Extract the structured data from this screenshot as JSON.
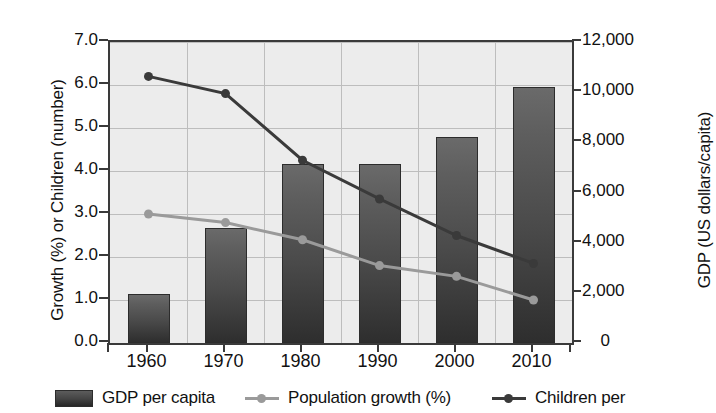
{
  "chart_data": {
    "type": "line",
    "title": "",
    "categories": [
      "1960",
      "1970",
      "1980",
      "1990",
      "2000",
      "2010"
    ],
    "x": [
      1960,
      1970,
      1980,
      1990,
      2000,
      2010
    ],
    "xlabel": "",
    "grid": true,
    "legend_position": "bottom",
    "left_axis": {
      "label": "Growth (%) or Children (number)",
      "ticks": [
        "0.0",
        "1.0",
        "2.0",
        "3.0",
        "4.0",
        "5.0",
        "6.0",
        "7.0"
      ],
      "tick_values": [
        0.0,
        1.0,
        2.0,
        3.0,
        4.0,
        5.0,
        6.0,
        7.0
      ],
      "ylim": [
        0.0,
        7.0
      ]
    },
    "right_axis": {
      "label": "GDP (US dollars/capita)",
      "ticks": [
        "0",
        "2,000",
        "4,000",
        "6,000",
        "8,000",
        "10,000",
        "12,000"
      ],
      "tick_values": [
        0,
        2000,
        4000,
        6000,
        8000,
        10000,
        12000
      ],
      "ylim": [
        0,
        12000
      ]
    },
    "series": [
      {
        "name": "GDP per capita",
        "type": "bar",
        "axis": "right",
        "color": "#3f3f3f",
        "values": [
          1970,
          4600,
          7150,
          7150,
          8200,
          10200
        ]
      },
      {
        "name": "Population growth (%)",
        "type": "line",
        "axis": "left",
        "color": "#9a9a9a",
        "values": [
          3.0,
          2.8,
          2.4,
          1.8,
          1.55,
          1.0
        ]
      },
      {
        "name": "Children per",
        "type": "line",
        "axis": "left",
        "color": "#3a3a3a",
        "values": [
          6.2,
          5.8,
          4.25,
          3.35,
          2.5,
          1.85
        ]
      }
    ]
  },
  "legend": {
    "items": [
      {
        "label": "GDP per capita",
        "marker": "bar-swatch",
        "color": "#3f3f3f"
      },
      {
        "label": "Population growth (%)",
        "marker": "line-dot",
        "color": "#9a9a9a"
      },
      {
        "label": "Children per",
        "marker": "line-dot",
        "color": "#3a3a3a"
      }
    ]
  }
}
